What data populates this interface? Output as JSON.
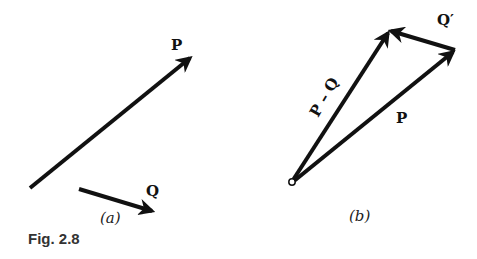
{
  "figure": {
    "caption": "Fig. 2.8",
    "panel_a": {
      "label": "(a)",
      "vectors": [
        {
          "name": "P",
          "label": "P",
          "from": [
            30,
            188
          ],
          "to": [
            192,
            56
          ]
        },
        {
          "name": "Q",
          "label": "Q",
          "from": [
            79,
            188
          ],
          "to": [
            155,
            212
          ]
        }
      ]
    },
    "panel_b": {
      "label": "(b)",
      "origin": [
        292,
        182
      ],
      "vectors": [
        {
          "name": "P",
          "label": "P",
          "from": [
            292,
            182
          ],
          "to": [
            455,
            50
          ]
        },
        {
          "name": "P-Q",
          "label": "P – Q",
          "from": [
            292,
            182
          ],
          "to": [
            389,
            30
          ]
        },
        {
          "name": "Q-prime",
          "label": "Q′",
          "from": [
            455,
            50
          ],
          "to": [
            389,
            30
          ]
        }
      ]
    },
    "colors": {
      "ink": "#111111",
      "background": "#ffffff"
    }
  }
}
